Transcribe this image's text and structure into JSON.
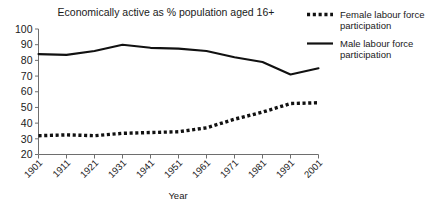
{
  "chart_data": {
    "type": "line",
    "title": "Economically active as % population aged 16+",
    "xlabel": "Year",
    "ylabel": "",
    "categories": [
      "1901",
      "1911",
      "1921",
      "1931",
      "1941",
      "1951",
      "1961",
      "1971",
      "1981",
      "1991",
      "2001"
    ],
    "x": [
      1901,
      1911,
      1921,
      1931,
      1941,
      1951,
      1961,
      1971,
      1981,
      1991,
      2001
    ],
    "xlim": [
      1901,
      2001
    ],
    "ylim": [
      20,
      100
    ],
    "yticks": [
      20,
      30,
      40,
      50,
      60,
      70,
      80,
      90,
      100
    ],
    "grid": false,
    "legend_position": "top-right",
    "series": [
      {
        "name": "Female labour force participation",
        "style": "dashed",
        "color": "#111111",
        "values": [
          32,
          32.5,
          32,
          33.5,
          34,
          34.5,
          37,
          42.5,
          47,
          52.5,
          53
        ]
      },
      {
        "name": "Male labour force participation",
        "style": "solid",
        "color": "#111111",
        "values": [
          84,
          83.5,
          86,
          90,
          88,
          87.5,
          86,
          82,
          79,
          71,
          75
        ]
      }
    ]
  },
  "legend": {
    "items": [
      {
        "label_line1": "Female labour force",
        "label_line2": "participation",
        "swatch": "dashed-line-swatch"
      },
      {
        "label_line1": "Male labour force",
        "label_line2": "participation",
        "swatch": "solid-line-swatch"
      }
    ]
  },
  "axis": {
    "y_tick_labels": [
      "100",
      "90",
      "80",
      "70",
      "60",
      "50",
      "40",
      "30",
      "20"
    ],
    "x_tick_labels": [
      "1901",
      "1911",
      "1921",
      "1931",
      "1941",
      "1951",
      "1961",
      "1971",
      "1981",
      "1991",
      "2001"
    ],
    "x_axis_title": "Year"
  }
}
